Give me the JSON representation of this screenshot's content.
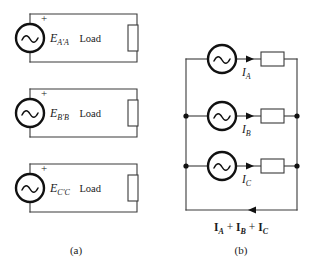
{
  "figure": {
    "background_color": "#ffffff",
    "line_color": "#3a3a3a",
    "source_color": "#111111"
  },
  "panel_a": {
    "caption": "(a)",
    "load_label": "Load",
    "polarity_label": "+",
    "circuits": [
      {
        "name": "phase-a",
        "source_symbol": "ac-source",
        "source_label_main": "E",
        "source_label_sub": "A'A",
        "load_label": "Load",
        "polarity_label": "+"
      },
      {
        "name": "phase-b",
        "source_symbol": "ac-source",
        "source_label_main": "E",
        "source_label_sub": "B'B",
        "load_label": "Load",
        "polarity_label": "+"
      },
      {
        "name": "phase-c",
        "source_symbol": "ac-source",
        "source_label_main": "E",
        "source_label_sub": "C'C",
        "load_label": "Load",
        "polarity_label": "+"
      }
    ]
  },
  "panel_b": {
    "caption": "(b)",
    "branches": [
      {
        "name": "branch-a",
        "source_symbol": "ac-source",
        "current_main": "I",
        "current_sub": "A"
      },
      {
        "name": "branch-b",
        "source_symbol": "ac-source",
        "current_main": "I",
        "current_sub": "B"
      },
      {
        "name": "branch-c",
        "source_symbol": "ac-source",
        "current_main": "I",
        "current_sub": "C"
      }
    ],
    "return_current": {
      "term_1_main": "I",
      "term_1_sub": "A",
      "operator_1": " + ",
      "term_2_main": "I",
      "term_2_sub": "B",
      "operator_2": " + ",
      "term_3_main": "I",
      "term_3_sub": "C"
    }
  }
}
